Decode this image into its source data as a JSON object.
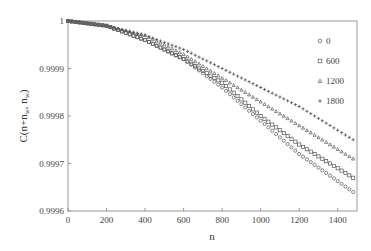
{
  "chart_data": {
    "type": "scatter",
    "title": "",
    "xlabel": "n",
    "ylabel": "C(n+n_w, n_w)",
    "ylabel_main": "C(n+n",
    "ylabel_sub1": "w",
    "ylabel_mid": ", n",
    "ylabel_sub2": "w",
    "ylabel_end": ")",
    "xlim": [
      0,
      1500
    ],
    "ylim": [
      0.9996,
      1.0
    ],
    "x_ticks": [
      0,
      200,
      400,
      600,
      800,
      1000,
      1200,
      1400
    ],
    "x_tick_labels": [
      "0",
      "200",
      "400",
      "600",
      "800",
      "1000",
      "1200",
      "1400"
    ],
    "y_ticks": [
      0.9996,
      0.9997,
      0.9998,
      0.9999,
      1.0
    ],
    "y_tick_labels": [
      "0.9996",
      "0.9997",
      "0.9998",
      "0.9999",
      "1"
    ],
    "grid": false,
    "legend_position": "upper right",
    "x": [
      0,
      200,
      400,
      600,
      800,
      1000,
      1200,
      1480
    ],
    "series": [
      {
        "name": "0",
        "marker": "circle",
        "values": [
          1.0,
          0.99999,
          0.99996,
          0.99992,
          0.99986,
          0.99979,
          0.99972,
          0.99964
        ]
      },
      {
        "name": "600",
        "marker": "square",
        "values": [
          1.0,
          0.99999,
          0.99996,
          0.99992,
          0.99987,
          0.9998,
          0.99974,
          0.99967
        ]
      },
      {
        "name": "1200",
        "marker": "triangle",
        "values": [
          1.0,
          0.99999,
          0.99997,
          0.99993,
          0.99988,
          0.99983,
          0.99978,
          0.99971
        ]
      },
      {
        "name": "1800",
        "marker": "plus",
        "values": [
          1.0,
          0.99999,
          0.99997,
          0.99994,
          0.9999,
          0.99986,
          0.99982,
          0.99975
        ]
      }
    ],
    "marker_color": "#555555",
    "axis_color": "#999999"
  }
}
